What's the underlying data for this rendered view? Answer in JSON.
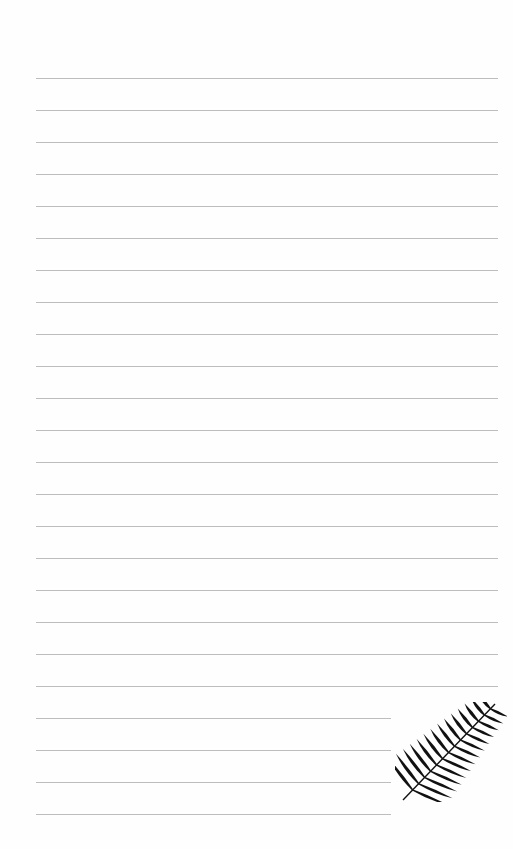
{
  "page": {
    "type": "lined-notepaper",
    "background_color": "#ffffff",
    "rule_color": "#bdbdbd",
    "full_rules": {
      "count": 20,
      "x_start": 36,
      "x_end": 498,
      "y_first": 78,
      "spacing": 32
    },
    "short_rules": {
      "count": 4,
      "x_start": 36,
      "x_end": 391,
      "y_first": 718,
      "spacing": 32
    },
    "decoration": {
      "icon": "palm-leaf-icon",
      "color": "#111111"
    }
  }
}
